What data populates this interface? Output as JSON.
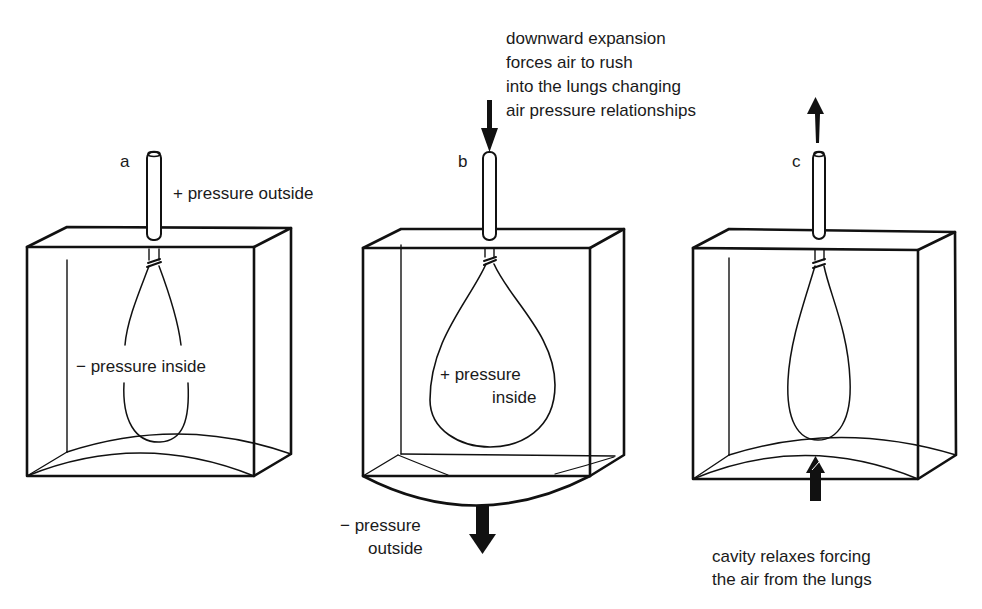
{
  "diagram": {
    "type": "lung-model-bell-jar",
    "colors": {
      "stroke": "#111111",
      "background": "#ffffff",
      "text": "#1a1a1a"
    }
  },
  "panels": [
    {
      "id": "a",
      "letter": "a",
      "labels": {
        "outside": "+ pressure outside",
        "inside": "− pressure inside"
      },
      "arrows": []
    },
    {
      "id": "b",
      "letter": "b",
      "labels": {
        "annotation": [
          "downward expansion",
          "forces air to rush",
          "into the lungs changing",
          "air pressure relationships"
        ],
        "inside_line1": "+ pressure",
        "inside_line2": "inside",
        "outside_line1": "− pressure",
        "outside_line2": "outside"
      },
      "arrows": [
        "down-arrow-into-tube",
        "down-arrow-diaphragm"
      ]
    },
    {
      "id": "c",
      "letter": "c",
      "labels": {
        "annotation": [
          "cavity relaxes forcing",
          "the air from the lungs"
        ]
      },
      "arrows": [
        "up-arrow-out-of-tube",
        "up-arrow-diaphragm"
      ]
    }
  ]
}
